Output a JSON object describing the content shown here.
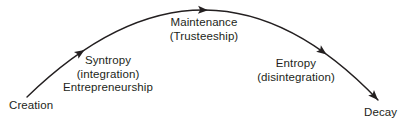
{
  "diagram": {
    "type": "lifecycle-arc",
    "colors": {
      "stroke": "#231f20",
      "text": "#231f20",
      "background": "#ffffff"
    },
    "stages": {
      "creation": {
        "label": "Creation"
      },
      "syntropy": {
        "lines": [
          "Syntropy",
          "(integration)",
          "Entrepreneurship"
        ]
      },
      "maintenance": {
        "lines": [
          "Maintenance",
          "(Trusteeship)"
        ]
      },
      "entropy": {
        "lines": [
          "Entropy",
          "(disintegration)"
        ]
      },
      "decay": {
        "label": "Decay"
      }
    }
  }
}
